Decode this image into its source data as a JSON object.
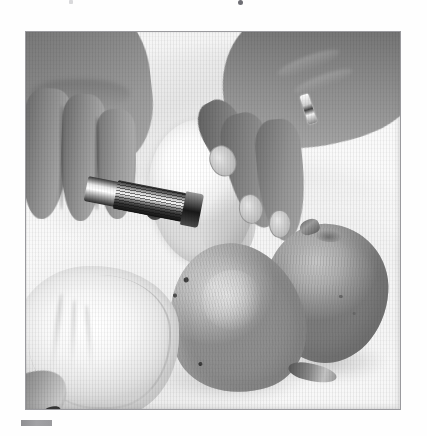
{
  "page": {
    "background_color": "#ffffff",
    "type": "scanned-book-page",
    "top_text_fragment_note": "cut-off descenders of a line of text at the very top edge"
  },
  "photo": {
    "alt": "Black and white photograph: two hands coring a peeled pear with a metal corer while two whole pears rest on a textured cloth",
    "frame_border_color": "#9a9a9e",
    "frame_x": 25,
    "frame_y": 31,
    "frame_width": 376,
    "frame_height": 379,
    "color_mode": "black-and-white",
    "subjects": {
      "left_hand_label": "left hand gripping corer handle",
      "right_hand_label": "right hand steadying the fruit",
      "ring_label": "wedding ring on ring finger",
      "tool_label": "metal apple/pear corer",
      "peeled_fruit_label": "peeled pear being cored",
      "pear_left_label": "whole pear lying on its side",
      "pear_right_label": "whole round pear",
      "cloth_label": "white cloth towel / mesh bag",
      "surface_label": "woven white cloth surface"
    }
  },
  "caption_bar": {
    "label": "caption marker bar",
    "color": "#9a9a9d",
    "x": 21,
    "y": 420,
    "width": 31,
    "height": 6
  }
}
